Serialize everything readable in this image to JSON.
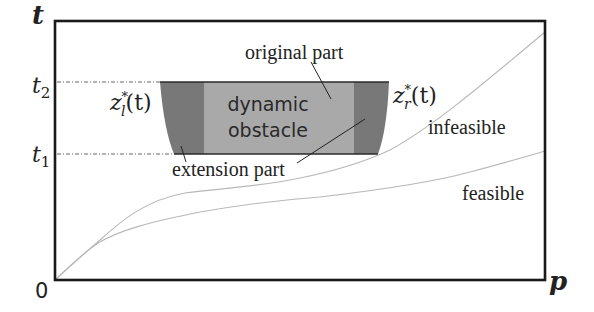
{
  "diagram": {
    "axes": {
      "y_label": "t",
      "x_label": "p",
      "origin_label": "0",
      "t2_label": "t",
      "t2_sub": "2",
      "t1_label": "t",
      "t1_sub": "1"
    },
    "obstacle": {
      "title_line1": "dynamic",
      "title_line2": "obstacle",
      "original_part_label": "original part",
      "extension_part_label": "extension part",
      "left_boundary_label": "z",
      "left_boundary_sub": "l",
      "left_boundary_sup": "*",
      "left_boundary_arg": "(t)",
      "right_boundary_label": "z",
      "right_boundary_sub": "r",
      "right_boundary_sup": "*",
      "right_boundary_arg": "(t)"
    },
    "regions": {
      "infeasible_label": "infeasible",
      "feasible_label": "feasible"
    },
    "colors": {
      "frame": "#1a1a1a",
      "original_part": "#a9a9a9",
      "extension_part": "#787878",
      "curve": "#b8b8b8",
      "guide": "#555555",
      "text": "#222222"
    }
  }
}
